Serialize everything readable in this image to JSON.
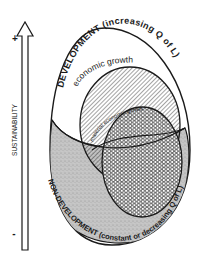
{
  "axis": {
    "label": "SUSTAINABILITY",
    "plus": "+",
    "minus": "-"
  },
  "regions": {
    "development": "DEVELOPMENT (increasing Q of L)",
    "economic_growth": "economic growth",
    "material_economic_growth": "material  economic  growth",
    "non_development": "NON-DEVELOPMENT (constant or decreasing Q of L)"
  },
  "colors": {
    "ink": "#1a1a1a",
    "stipple": "#b8b8b8",
    "background": "#ffffff"
  }
}
